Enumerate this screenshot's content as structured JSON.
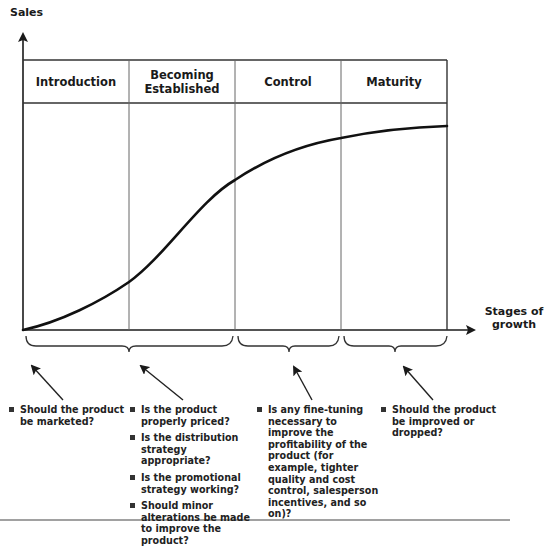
{
  "axes": {
    "y_label": "Sales",
    "x_label_line1": "Stages of",
    "x_label_line2": "growth"
  },
  "stages": [
    {
      "label": "Introduction"
    },
    {
      "label": "Becoming Established"
    },
    {
      "label": "Control"
    },
    {
      "label": "Maturity"
    }
  ],
  "question_groups": [
    {
      "stage": "Introduction",
      "items": [
        "Should the product be marketed?"
      ]
    },
    {
      "stage": "Becoming Established",
      "items": [
        "Is the product properly priced?",
        "Is the distribution strategy appropriate?",
        "Is the promotional strategy working?",
        "Should minor alterations be made to improve the product?"
      ]
    },
    {
      "stage": "Control",
      "items": [
        "Is any fine-tuning necessary to improve the profitability of the product (for example, tighter quality and cost control, salesperson incentives, and so on)?"
      ]
    },
    {
      "stage": "Maturity",
      "items": [
        "Should the product be improved or dropped?"
      ]
    }
  ],
  "colors": {
    "line": "#1a1a1a",
    "grid": "#555555",
    "text": "#1a1a1a"
  }
}
